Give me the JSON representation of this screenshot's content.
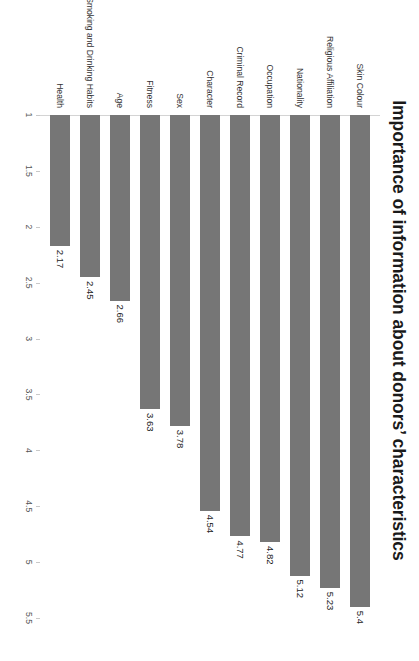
{
  "chart_data": {
    "type": "bar",
    "orientation": "vertical-page-rotated",
    "title": "Importance of information about donors’ characteristics",
    "xlabel": "",
    "ylabel": "",
    "categories": [
      "Skin Colour",
      "Religious Affiliation",
      "Nationality",
      "Occupation",
      "Criminal Record",
      "Character",
      "Sex",
      "Fitness",
      "Age",
      "Smoking and Drinking Habits",
      "Health"
    ],
    "values": [
      5.4,
      5.23,
      5.12,
      4.82,
      4.77,
      4.54,
      3.78,
      3.63,
      2.66,
      2.45,
      2.17
    ],
    "value_labels": [
      "5.4",
      "5.23",
      "5.12",
      "4.82",
      "4.77",
      "4.54",
      "3.78",
      "3.63",
      "2.66",
      "2.45",
      "2.17"
    ],
    "ylim": [
      1,
      5.5
    ],
    "axis_ticks": [
      1,
      1.5,
      2,
      2.5,
      3,
      3.5,
      4,
      4.5,
      5,
      5.5
    ],
    "axis_tick_labels": [
      "1",
      "1.5",
      "2",
      "2.5",
      "3",
      "3.5",
      "4",
      "4.5",
      "5",
      "5.5"
    ],
    "grid": false,
    "legend": null,
    "bar_color": "#767676",
    "background_color": "#ffffff",
    "axis_line_color": "#d4d4d4"
  }
}
